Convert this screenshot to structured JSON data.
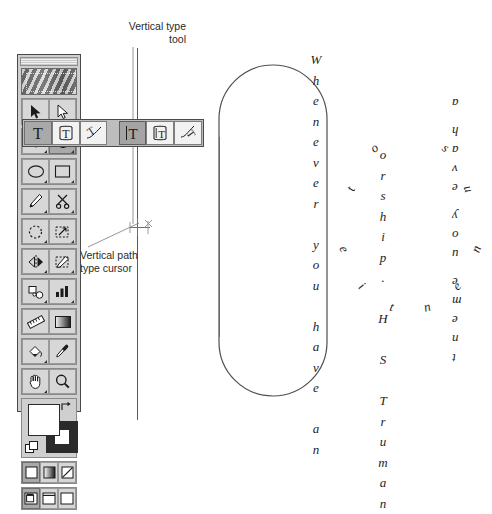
{
  "document": {
    "title": "Vertical Type Tool — Illustrator toolbox",
    "background_color": "#ffffff",
    "ink_color": "#1d1d1d"
  },
  "callouts": [
    {
      "id": "vertical-type-tool",
      "text": "Vertical type\ntool"
    },
    {
      "id": "vertical-path-type-cursor",
      "text": "Vertical path\ntype cursor"
    }
  ],
  "toolbox": {
    "name": "Toolbox palette",
    "titlebar_label": "",
    "logo_label": "",
    "groups": [
      {
        "name": "selection-group",
        "tools": [
          {
            "name": "selection-tool",
            "icon": "arrow-solid-icon",
            "selected": false,
            "has_flyout": false
          },
          {
            "name": "direct-selection-tool",
            "icon": "arrow-outline-icon",
            "selected": false,
            "has_flyout": true
          }
        ]
      },
      {
        "name": "pen-type-group",
        "tools": [
          {
            "name": "pen-tool",
            "icon": "pen-nib-icon",
            "selected": false,
            "has_flyout": true
          },
          {
            "name": "type-tool",
            "icon": "type-t-icon",
            "selected": true,
            "has_flyout": true
          }
        ]
      },
      {
        "name": "shape-group",
        "tools": [
          {
            "name": "ellipse-tool",
            "icon": "ellipse-icon",
            "selected": false,
            "has_flyout": true
          },
          {
            "name": "rectangle-tool",
            "icon": "rectangle-icon",
            "selected": false,
            "has_flyout": true
          }
        ]
      },
      {
        "name": "draw-edit-group",
        "tools": [
          {
            "name": "pencil-tool",
            "icon": "pencil-icon",
            "selected": false,
            "has_flyout": true
          },
          {
            "name": "scissors-tool",
            "icon": "scissors-icon",
            "selected": false,
            "has_flyout": true
          }
        ]
      },
      {
        "name": "transform-group",
        "tools": [
          {
            "name": "rotate-tool",
            "icon": "rotate-dashed-icon",
            "selected": false,
            "has_flyout": true
          },
          {
            "name": "scale-tool",
            "icon": "scale-arrow-icon",
            "selected": false,
            "has_flyout": true
          }
        ]
      },
      {
        "name": "reshape-group",
        "tools": [
          {
            "name": "reflect-tool",
            "icon": "reflect-icon",
            "selected": false,
            "has_flyout": true
          },
          {
            "name": "free-distort-tool",
            "icon": "free-distort-icon",
            "selected": false,
            "has_flyout": true
          }
        ]
      },
      {
        "name": "blend-graph-group",
        "tools": [
          {
            "name": "blend-tool",
            "icon": "blend-shapes-icon",
            "selected": false,
            "has_flyout": true
          },
          {
            "name": "graph-tool",
            "icon": "bar-graph-icon",
            "selected": false,
            "has_flyout": true
          }
        ]
      },
      {
        "name": "measure-gradient-group",
        "tools": [
          {
            "name": "measure-tool",
            "icon": "ruler-icon",
            "selected": false,
            "has_flyout": false
          },
          {
            "name": "gradient-tool",
            "icon": "gradient-swatch-icon",
            "selected": false,
            "has_flyout": false
          }
        ]
      },
      {
        "name": "paint-sample-group",
        "tools": [
          {
            "name": "paint-bucket-tool",
            "icon": "paint-bucket-icon",
            "selected": false,
            "has_flyout": true
          },
          {
            "name": "eyedropper-tool",
            "icon": "eyedropper-icon",
            "selected": false,
            "has_flyout": false
          }
        ]
      },
      {
        "name": "view-group",
        "tools": [
          {
            "name": "hand-tool",
            "icon": "hand-icon",
            "selected": false,
            "has_flyout": true
          },
          {
            "name": "zoom-tool",
            "icon": "magnifier-icon",
            "selected": false,
            "has_flyout": false
          }
        ]
      }
    ],
    "color_controls": {
      "name": "fill-and-stroke",
      "fill_color": "#ffffff",
      "stroke_color": "#000000",
      "swap_icon": "swap-fill-stroke-icon",
      "default_icon": "default-fill-stroke-icon"
    },
    "paint_modes": [
      {
        "name": "color-mode",
        "icon": "solid-color-icon",
        "selected": true
      },
      {
        "name": "gradient-mode",
        "icon": "gradient-icon",
        "selected": false
      },
      {
        "name": "none-mode",
        "icon": "none-slash-icon",
        "selected": false
      }
    ],
    "screen_modes": [
      {
        "name": "standard-screen-mode",
        "icon": "standard-screen-icon",
        "selected": true
      },
      {
        "name": "full-screen-with-menu-mode",
        "icon": "full-screen-menu-icon",
        "selected": false
      },
      {
        "name": "full-screen-mode",
        "icon": "full-screen-icon",
        "selected": false
      }
    ]
  },
  "type_flyout": {
    "name": "Type tool flyout",
    "items": [
      {
        "name": "type-tool",
        "icon": "type-t-icon",
        "state": "source"
      },
      {
        "name": "area-type-tool",
        "icon": "area-type-icon",
        "state": "normal"
      },
      {
        "name": "path-type-tool",
        "icon": "path-type-icon",
        "state": "normal"
      },
      {
        "name": "vertical-type-tool",
        "icon": "vertical-type-t-icon",
        "state": "selected"
      },
      {
        "name": "vertical-area-type-tool",
        "icon": "vertical-area-type-icon",
        "state": "normal"
      },
      {
        "name": "vertical-path-type-tool",
        "icon": "vertical-path-type-icon",
        "state": "normal"
      }
    ]
  },
  "artwork": {
    "guide_line": {
      "name": "vertical-guide-path",
      "orientation": "vertical"
    },
    "cursor": {
      "name": "vertical-path-type-cursor-marker",
      "icon": "i-beam-crosshair-icon"
    },
    "stadium_path": {
      "name": "rounded-stadium-path",
      "stroke": "#4a4a4a"
    },
    "inner_line": {
      "name": "stadium-inner-vertical-line",
      "stroke": "#4a4a4a"
    },
    "vertical_type_sample": {
      "name": "vertical-type-sample",
      "columns": [
        {
          "name": "vertical-column-1",
          "chars": [
            "W",
            "h",
            "e",
            "n",
            "e",
            "v",
            "e",
            "r",
            "",
            "y",
            "o",
            "u",
            "",
            "h",
            "a",
            "v",
            "e",
            "",
            "a",
            "n"
          ]
        },
        {
          "name": "vertical-column-2",
          "chars": [
            "o",
            "r",
            "s",
            "h",
            "i",
            "p",
            ".",
            "",
            "H",
            "",
            "S",
            "",
            "T",
            "r",
            "u",
            "m",
            "a",
            "n"
          ]
        }
      ],
      "full_text": "Whenever you have an ... orship. H S Truman"
    },
    "path_type_sample": {
      "name": "path-type-sample",
      "text": "to su",
      "bottom_text": "eitnen",
      "right_text": "a have you ement",
      "note": "Type flowed around an oval path"
    }
  }
}
